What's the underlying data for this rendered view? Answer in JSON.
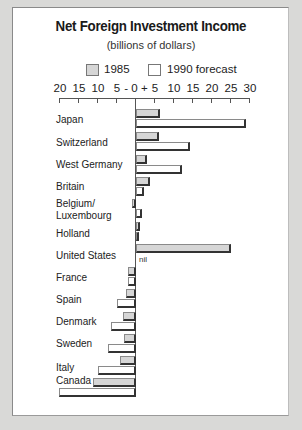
{
  "chart_data": {
    "type": "bar",
    "orientation": "horizontal",
    "title": "Net Foreign Investment Income",
    "subtitle": "(billions of dollars)",
    "xlabel": "",
    "ylabel": "",
    "xlim": [
      -20,
      30
    ],
    "x_ticks": [
      "20",
      "15",
      "10",
      "5",
      "- 0 +",
      "5",
      "10",
      "15",
      "20",
      "25",
      "30"
    ],
    "x_tick_values": [
      -20,
      -15,
      -10,
      -5,
      0,
      5,
      10,
      15,
      20,
      25,
      30
    ],
    "grid": false,
    "legend_position": "top",
    "categories": [
      "Japan",
      "Switzerland",
      "West Germany",
      "Britain",
      "Belgium/\nLuxembourg",
      "Holland",
      "United States",
      "France",
      "Spain",
      "Denmark",
      "Sweden",
      "Italy",
      "Canada"
    ],
    "series": [
      {
        "name": "1985",
        "color": "#d6d6d6",
        "values": [
          6.2,
          6,
          3,
          3.8,
          -1,
          1,
          25,
          -2.2,
          -2.6,
          -3.4,
          -3.2,
          -4.2,
          -11.2
        ]
      },
      {
        "name": "1990 forecast",
        "color": "#ffffff",
        "values": [
          29,
          14.2,
          12,
          2,
          1.6,
          0.6,
          0,
          -2,
          -5,
          -6.6,
          -7.5,
          -10,
          -20.2
        ]
      }
    ],
    "annotations": [
      {
        "category": "United States",
        "series": "1990 forecast",
        "text": "nil"
      }
    ]
  },
  "header": {
    "title": "Net Foreign Investment Income",
    "subtitle": "(billions of dollars)"
  },
  "legend": {
    "items": [
      {
        "label": "1985",
        "swatch": "#d6d6d6"
      },
      {
        "label": "1990 forecast",
        "swatch": "#ffffff"
      }
    ]
  },
  "axis": {
    "ticks": [
      {
        "label": "20",
        "value": -20
      },
      {
        "label": "15",
        "value": -15
      },
      {
        "label": "10",
        "value": -10
      },
      {
        "label": "5",
        "value": -5
      },
      {
        "label": "- 0 +",
        "value": 0
      },
      {
        "label": "5",
        "value": 5
      },
      {
        "label": "10",
        "value": 10
      },
      {
        "label": "15",
        "value": 15
      },
      {
        "label": "20",
        "value": 20
      },
      {
        "label": "25",
        "value": 25
      },
      {
        "label": "30",
        "value": 30
      }
    ]
  },
  "nil_label": "nil"
}
